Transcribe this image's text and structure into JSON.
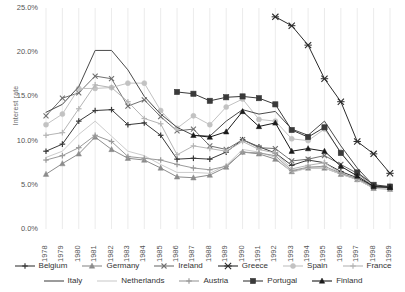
{
  "chart_data": {
    "type": "line",
    "title": "",
    "xlabel": "",
    "ylabel": "Interest rate",
    "grid": "vertical",
    "legend_position": "bottom",
    "ylim": [
      0,
      25
    ],
    "ytick_labels": [
      "25.0%",
      "20.0%",
      "15.0%",
      "10.0%",
      "5.0%",
      "0.0%"
    ],
    "ytick_values": [
      25,
      20,
      15,
      10,
      5,
      0
    ],
    "categories": [
      "1978",
      "1979",
      "1980",
      "1981",
      "1982",
      "1983",
      "1984",
      "1985",
      "1986",
      "1987",
      "1988",
      "1989",
      "1990",
      "1991",
      "1992",
      "1993",
      "1994",
      "1995",
      "1996",
      "1997",
      "1998",
      "1999"
    ],
    "series": [
      {
        "name": "Belgium",
        "marker": "plus",
        "color": "#3a3a3a",
        "values": [
          8.8,
          9.6,
          12.2,
          13.4,
          13.5,
          11.8,
          12.0,
          10.6,
          7.9,
          8.0,
          7.9,
          8.7,
          10.1,
          9.3,
          8.6,
          7.2,
          7.8,
          7.5,
          6.5,
          5.8,
          4.8,
          4.8
        ]
      },
      {
        "name": "Germany",
        "marker": "triangle",
        "color": "#8c8c8c",
        "values": [
          6.2,
          7.4,
          8.5,
          10.4,
          9.0,
          8.0,
          7.8,
          6.9,
          5.9,
          5.8,
          6.1,
          7.0,
          8.7,
          8.5,
          7.9,
          6.5,
          6.9,
          6.9,
          6.2,
          5.6,
          4.6,
          4.5
        ]
      },
      {
        "name": "Ireland",
        "marker": "x",
        "color": "#707070",
        "values": [
          12.8,
          14.8,
          15.4,
          17.3,
          17.0,
          13.9,
          14.6,
          12.7,
          11.1,
          11.3,
          9.4,
          9.0,
          10.1,
          9.2,
          9.1,
          7.7,
          7.9,
          8.3,
          7.3,
          6.3,
          4.8,
          4.7
        ]
      },
      {
        "name": "Greece",
        "marker": "x-big",
        "color": "#2b2b2b",
        "values": [
          null,
          null,
          null,
          null,
          null,
          null,
          null,
          null,
          null,
          null,
          null,
          null,
          null,
          null,
          24.0,
          23.0,
          20.8,
          17.0,
          14.4,
          9.9,
          8.5,
          6.3
        ]
      },
      {
        "name": "Spain",
        "marker": "circle",
        "color": "#c2c2c2",
        "values": [
          11.8,
          13.0,
          15.9,
          15.9,
          16.0,
          16.5,
          16.5,
          13.4,
          11.4,
          12.8,
          11.8,
          13.8,
          14.7,
          12.4,
          12.2,
          10.2,
          10.0,
          11.3,
          8.7,
          6.4,
          4.8,
          4.7
        ]
      },
      {
        "name": "France",
        "marker": "plus-light",
        "color": "#b5b5b5",
        "values": [
          10.6,
          10.9,
          13.6,
          16.3,
          16.0,
          14.4,
          12.5,
          11.9,
          8.4,
          9.4,
          9.1,
          8.8,
          9.9,
          9.0,
          8.6,
          6.8,
          7.2,
          7.5,
          6.3,
          5.6,
          4.7,
          4.6
        ]
      },
      {
        "name": "Italy",
        "marker": "none",
        "color": "#4a4a4a",
        "values": [
          13.2,
          14.1,
          16.1,
          20.2,
          20.2,
          18.0,
          15.0,
          13.0,
          11.5,
          10.6,
          10.5,
          12.2,
          13.5,
          13.0,
          13.3,
          11.3,
          10.6,
          12.2,
          9.4,
          6.9,
          4.9,
          4.7
        ]
      },
      {
        "name": "Netherlands",
        "marker": "none-light",
        "color": "#cccccc",
        "values": [
          8.1,
          8.8,
          10.7,
          12.2,
          10.5,
          8.8,
          8.3,
          7.3,
          6.4,
          6.4,
          6.3,
          7.2,
          9.0,
          8.7,
          8.1,
          6.4,
          6.9,
          6.9,
          6.2,
          5.6,
          4.6,
          4.6
        ]
      },
      {
        "name": "Austria",
        "marker": "plus-gray",
        "color": "#9a9a9a",
        "values": [
          7.8,
          8.3,
          9.2,
          10.6,
          9.9,
          8.2,
          8.0,
          7.8,
          7.3,
          6.9,
          6.7,
          7.1,
          8.7,
          8.6,
          8.3,
          6.6,
          7.0,
          7.1,
          6.3,
          5.7,
          4.7,
          4.7
        ]
      },
      {
        "name": "Portugal",
        "marker": "square",
        "color": "#3a3a3a",
        "values": [
          null,
          null,
          null,
          null,
          null,
          null,
          null,
          null,
          15.5,
          15.3,
          14.5,
          14.9,
          15.0,
          14.8,
          14.1,
          11.2,
          10.4,
          11.5,
          8.6,
          6.4,
          5.0,
          4.8
        ]
      },
      {
        "name": "Finland",
        "marker": "triangle-black",
        "color": "#1a1a1a",
        "values": [
          null,
          null,
          null,
          null,
          null,
          null,
          null,
          null,
          null,
          10.6,
          10.4,
          11.0,
          13.3,
          11.6,
          12.0,
          8.8,
          9.1,
          8.8,
          7.1,
          6.0,
          4.8,
          4.7
        ]
      }
    ]
  },
  "legend": {
    "row1": [
      "Belgium",
      "Germany",
      "Ireland",
      "Greece",
      "Spain",
      "France"
    ],
    "row2": [
      "Italy",
      "Netherlands",
      "Austria",
      "Portugal",
      "Finland"
    ]
  }
}
